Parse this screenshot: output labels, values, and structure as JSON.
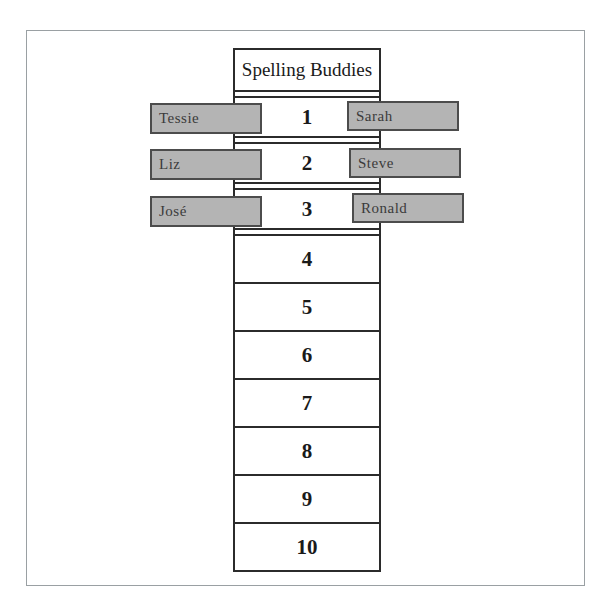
{
  "chart": {
    "title": "Spelling Buddies",
    "cells": [
      {
        "number": "1"
      },
      {
        "number": "2"
      },
      {
        "number": "3"
      },
      {
        "number": "4"
      },
      {
        "number": "5"
      },
      {
        "number": "6"
      },
      {
        "number": "7"
      },
      {
        "number": "8"
      },
      {
        "number": "9"
      },
      {
        "number": "10"
      }
    ],
    "left_tags": [
      {
        "name": "Tessie"
      },
      {
        "name": "Liz"
      },
      {
        "name": "José"
      }
    ],
    "right_tags": [
      {
        "name": "Sarah"
      },
      {
        "name": "Steve"
      },
      {
        "name": "Ronald"
      }
    ]
  },
  "colors": {
    "tag_fill": "#b4b4b4",
    "tag_border": "#4c4c4c",
    "grid_line": "#2b2b2b",
    "frame_border": "#9aa0a3",
    "text": "#1a1a1a",
    "tag_text": "#3b3b3b"
  }
}
